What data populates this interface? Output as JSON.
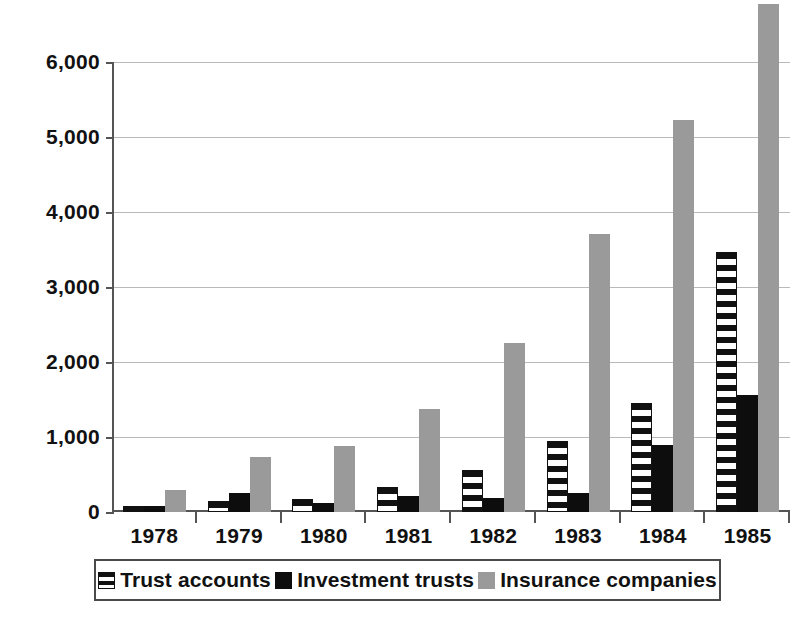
{
  "chart_data": {
    "type": "bar",
    "title": "",
    "subtitle": "",
    "xlabel": "",
    "ylabel": "",
    "ylim": [
      0,
      6000
    ],
    "yticks": [
      0,
      1000,
      2000,
      3000,
      4000,
      5000,
      6000
    ],
    "ytick_labels": [
      "0",
      "1,000",
      "2,000",
      "3,000",
      "4,000",
      "5,000",
      "6,000"
    ],
    "categories": [
      "1978",
      "1979",
      "1980",
      "1981",
      "1982",
      "1983",
      "1984",
      "1985"
    ],
    "grid": true,
    "legend_position": "bottom",
    "series": [
      {
        "name": "Trust accounts",
        "pattern": "horizontal-stripes",
        "color": "#111111",
        "values": [
          75,
          150,
          170,
          330,
          560,
          950,
          1450,
          3470
        ]
      },
      {
        "name": "Investment trusts",
        "pattern": "solid",
        "color": "#0d0d0d",
        "values": [
          75,
          255,
          120,
          210,
          190,
          250,
          890,
          1560
        ]
      },
      {
        "name": "Insurance companies",
        "pattern": "solid",
        "color": "#9a9a9a",
        "values": [
          300,
          730,
          880,
          1370,
          2260,
          3710,
          5230,
          6770
        ]
      }
    ]
  },
  "legend": {
    "items": [
      {
        "label": "Trust accounts",
        "swatch": "striped-swatch-icon"
      },
      {
        "label": "Investment trusts",
        "swatch": "black-swatch-icon"
      },
      {
        "label": "Insurance companies",
        "swatch": "gray-swatch-icon"
      }
    ]
  },
  "colors": {
    "trust_accounts": "#111111",
    "investment_trusts": "#0d0d0d",
    "insurance_companies": "#9a9a9a",
    "gridline": "#b9b9b9",
    "axis": "#555555",
    "background": "#ffffff"
  }
}
